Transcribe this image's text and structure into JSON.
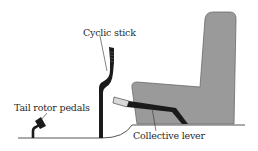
{
  "diagram": {
    "labels": {
      "cyclic": "Cyclic stick",
      "pedals": "Tail rotor pedals",
      "collective": "Collective lever"
    },
    "colors": {
      "seat_fill": "#9a9a9a",
      "seat_outline": "#5a5a5a",
      "control_black": "#1a1a1a",
      "collective_grip": "#d8d8d8",
      "floor_line": "#555555",
      "text": "#2a2a2a"
    }
  }
}
